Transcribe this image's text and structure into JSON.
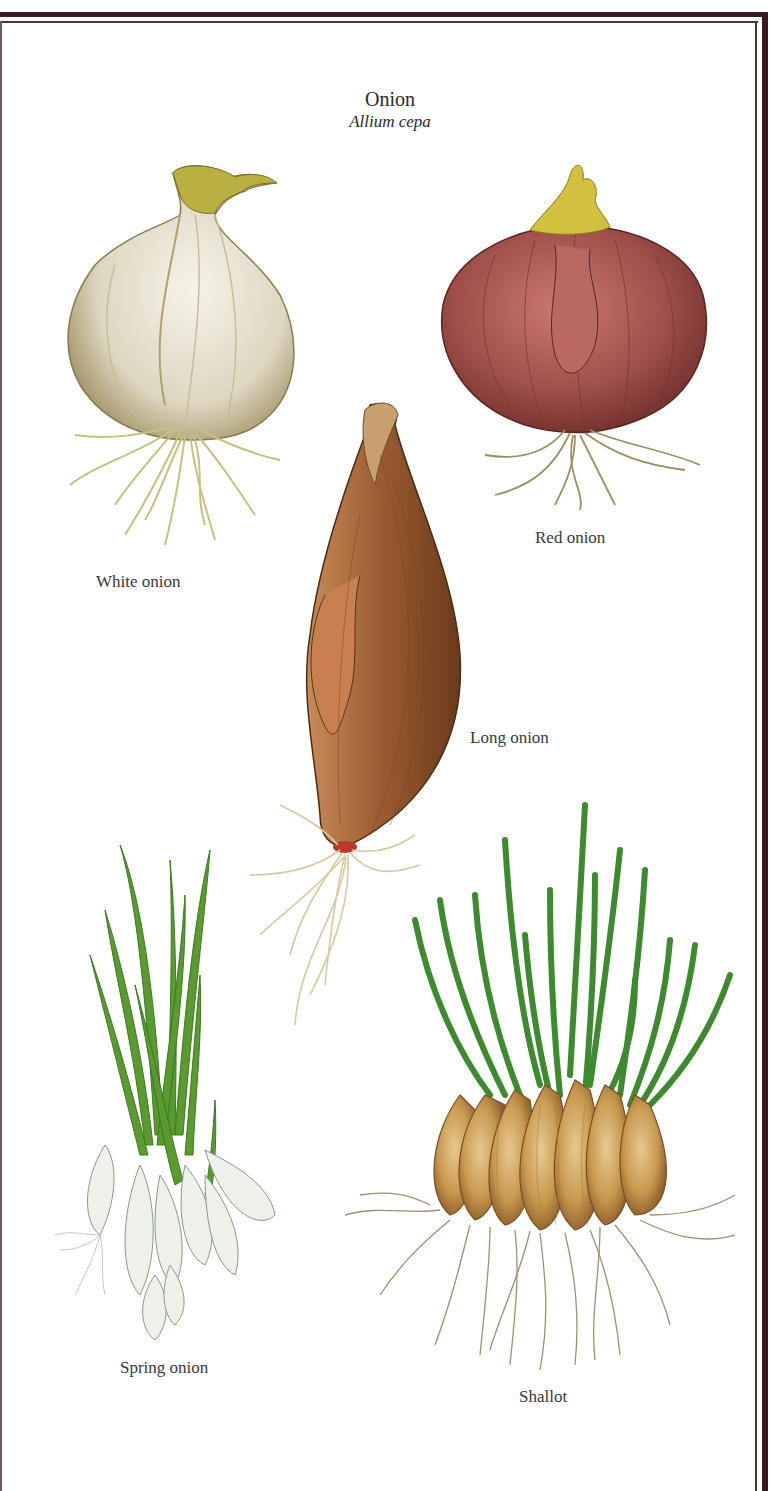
{
  "plate": {
    "title": "Onion",
    "scientific_name": "Allium cepa",
    "frame_color": "#3a1a1c",
    "background": "#ffffff"
  },
  "specimens": [
    {
      "id": "white-onion",
      "caption": "White onion",
      "colors": {
        "bulb": "#e8e4d6",
        "shade": "#b9ad86",
        "neck": "#b8b040",
        "roots": "#c8c080"
      }
    },
    {
      "id": "red-onion",
      "caption": "Red onion",
      "colors": {
        "bulb": "#a0504a",
        "shade": "#6e2e2a",
        "neck": "#d4c040",
        "roots": "#9a9060"
      }
    },
    {
      "id": "long-onion",
      "caption": "Long onion",
      "colors": {
        "bulb": "#9a5a30",
        "shade": "#6a3a1c",
        "roots": "#d8c8a0"
      }
    },
    {
      "id": "spring-onion",
      "caption": "Spring onion",
      "colors": {
        "leaves": "#5a9a30",
        "bulbs": "#eef0ea",
        "roots": "#c8c8c0"
      }
    },
    {
      "id": "shallot",
      "caption": "Shallot",
      "colors": {
        "leaves": "#3e8a2e",
        "bulbs": "#c89a50",
        "shade": "#9a6a30",
        "roots": "#a09070"
      }
    }
  ]
}
